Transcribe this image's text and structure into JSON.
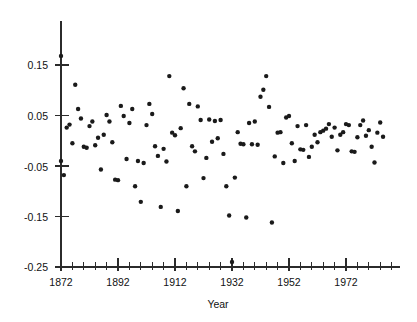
{
  "chart_data": {
    "type": "scatter",
    "title": "",
    "xlabel": "Year",
    "ylabel": "",
    "xlim": [
      1869,
      1988
    ],
    "ylim": [
      -0.25,
      0.18
    ],
    "grid": false,
    "legend": null,
    "x_ticks": [
      1872,
      1892,
      1912,
      1932,
      1952,
      1972
    ],
    "x_tick_labels": [
      "1872",
      "1892",
      "1912",
      "1932",
      "1952",
      "1972"
    ],
    "x_minor_tick_step": 4,
    "y_ticks": [
      0.15,
      0.05,
      -0.05,
      -0.15,
      -0.25
    ],
    "y_tick_labels": [
      "0.15",
      "0.05",
      "-0.05",
      "-0.15",
      "-0.25"
    ],
    "marker": "dot",
    "marker_color": "#1a1a1a",
    "marker_size": 2.2,
    "points": [
      [
        1872,
        0.168
      ],
      [
        1872,
        -0.04
      ],
      [
        1873,
        -0.068
      ],
      [
        1874,
        0.026
      ],
      [
        1875,
        0.032
      ],
      [
        1876,
        -0.005
      ],
      [
        1877,
        0.111
      ],
      [
        1878,
        0.063
      ],
      [
        1879,
        0.044
      ],
      [
        1880,
        -0.012
      ],
      [
        1881,
        -0.014
      ],
      [
        1882,
        0.029
      ],
      [
        1883,
        0.038
      ],
      [
        1884,
        -0.009
      ],
      [
        1885,
        0.006
      ],
      [
        1886,
        -0.057
      ],
      [
        1887,
        0.012
      ],
      [
        1888,
        0.051
      ],
      [
        1889,
        0.038
      ],
      [
        1890,
        -0.003
      ],
      [
        1891,
        -0.077
      ],
      [
        1892,
        -0.078
      ],
      [
        1893,
        0.069
      ],
      [
        1894,
        0.049
      ],
      [
        1895,
        -0.036
      ],
      [
        1896,
        0.035
      ],
      [
        1897,
        0.063
      ],
      [
        1898,
        -0.09
      ],
      [
        1899,
        -0.04
      ],
      [
        1900,
        -0.121
      ],
      [
        1901,
        -0.044
      ],
      [
        1902,
        0.031
      ],
      [
        1903,
        0.073
      ],
      [
        1904,
        0.053
      ],
      [
        1905,
        -0.011
      ],
      [
        1906,
        -0.03
      ],
      [
        1907,
        -0.131
      ],
      [
        1908,
        -0.016
      ],
      [
        1909,
        -0.041
      ],
      [
        1910,
        0.128
      ],
      [
        1911,
        0.016
      ],
      [
        1912,
        0.011
      ],
      [
        1913,
        -0.139
      ],
      [
        1914,
        0.025
      ],
      [
        1915,
        0.104
      ],
      [
        1916,
        -0.09
      ],
      [
        1917,
        0.073
      ],
      [
        1918,
        -0.011
      ],
      [
        1919,
        -0.021
      ],
      [
        1920,
        0.068
      ],
      [
        1921,
        0.041
      ],
      [
        1922,
        -0.074
      ],
      [
        1923,
        -0.034
      ],
      [
        1924,
        0.042
      ],
      [
        1925,
        -0.002
      ],
      [
        1926,
        0.039
      ],
      [
        1927,
        0.005
      ],
      [
        1928,
        0.041
      ],
      [
        1929,
        -0.026
      ],
      [
        1930,
        -0.09
      ],
      [
        1931,
        -0.148
      ],
      [
        1932,
        -0.24
      ],
      [
        1933,
        -0.073
      ],
      [
        1934,
        0.017
      ],
      [
        1935,
        -0.006
      ],
      [
        1936,
        -0.007
      ],
      [
        1937,
        -0.152
      ],
      [
        1938,
        0.035
      ],
      [
        1939,
        -0.007
      ],
      [
        1940,
        0.038
      ],
      [
        1941,
        -0.008
      ],
      [
        1942,
        0.087
      ],
      [
        1943,
        0.101
      ],
      [
        1944,
        0.128
      ],
      [
        1945,
        0.067
      ],
      [
        1946,
        -0.162
      ],
      [
        1947,
        -0.031
      ],
      [
        1948,
        0.016
      ],
      [
        1949,
        0.017
      ],
      [
        1950,
        -0.044
      ],
      [
        1951,
        0.046
      ],
      [
        1952,
        0.049
      ],
      [
        1953,
        -0.005
      ],
      [
        1954,
        -0.04
      ],
      [
        1955,
        0.029
      ],
      [
        1956,
        -0.017
      ],
      [
        1957,
        -0.018
      ],
      [
        1958,
        0.031
      ],
      [
        1959,
        -0.032
      ],
      [
        1960,
        -0.012
      ],
      [
        1961,
        0.012
      ],
      [
        1962,
        -0.003
      ],
      [
        1963,
        0.017
      ],
      [
        1964,
        0.02
      ],
      [
        1965,
        0.024
      ],
      [
        1966,
        0.033
      ],
      [
        1967,
        0.008
      ],
      [
        1968,
        0.026
      ],
      [
        1969,
        -0.019
      ],
      [
        1970,
        0.012
      ],
      [
        1971,
        0.017
      ],
      [
        1972,
        0.033
      ],
      [
        1973,
        0.031
      ],
      [
        1974,
        -0.021
      ],
      [
        1975,
        -0.022
      ],
      [
        1976,
        0.007
      ],
      [
        1977,
        0.031
      ],
      [
        1978,
        0.04
      ],
      [
        1979,
        0.01
      ],
      [
        1980,
        0.021
      ],
      [
        1981,
        -0.012
      ],
      [
        1982,
        -0.043
      ],
      [
        1983,
        0.016
      ],
      [
        1984,
        0.036
      ],
      [
        1985,
        0.008
      ]
    ]
  }
}
